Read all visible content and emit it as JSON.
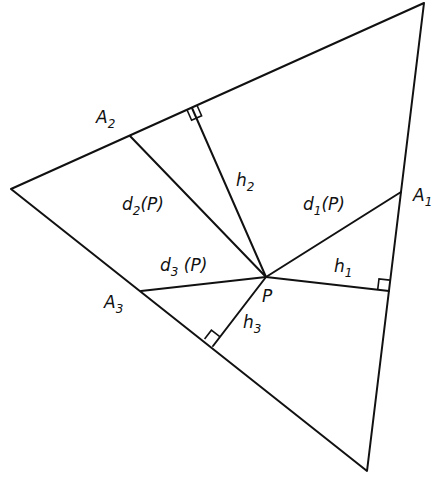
{
  "diagram": {
    "type": "geometry-figure",
    "colors": {
      "stroke": "#111111",
      "background": "#ffffff"
    },
    "vertices": {
      "top": [
        424,
        3
      ],
      "left": [
        11,
        189
      ],
      "bottom": [
        367,
        471
      ]
    },
    "point_P": [
      266,
      277
    ],
    "side_points": {
      "A1": [
        401,
        192
      ],
      "A2": [
        130,
        136
      ],
      "A3": [
        141,
        291
      ]
    },
    "feet": {
      "h1": [
        389,
        291
      ],
      "h2": [
        192,
        108
      ],
      "h3": [
        213,
        346
      ]
    },
    "labels": {
      "A1": {
        "base": "A",
        "sub": "1"
      },
      "A2": {
        "base": "A",
        "sub": "2"
      },
      "A3": {
        "base": "A",
        "sub": "3"
      },
      "P": {
        "base": "P"
      },
      "h1": {
        "base": "h",
        "sub": "1"
      },
      "h2": {
        "base": "h",
        "sub": "2"
      },
      "h3": {
        "base": "h",
        "sub": "3"
      },
      "d1": {
        "base": "d",
        "sub": "1",
        "suffix": "(P)"
      },
      "d2": {
        "base": "d",
        "sub": "2",
        "suffix": "(P)"
      },
      "d3": {
        "base": "d",
        "sub": "3",
        "suffix": " (P)"
      }
    }
  }
}
